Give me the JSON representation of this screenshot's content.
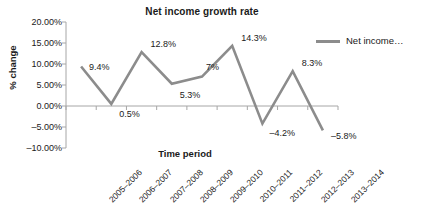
{
  "chart_data": {
    "type": "line",
    "title": "Net income growth rate",
    "xlabel": "Time period",
    "ylabel": "% change",
    "categories": [
      "2005–2006",
      "2006–2007",
      "2007–2008",
      "2008–2009",
      "2009–2010",
      "2010–2011",
      "2011–2012",
      "2012–2013",
      "2013–2014"
    ],
    "values": [
      9.4,
      0.5,
      12.8,
      5.3,
      7,
      14.3,
      -4.2,
      8.3,
      -5.8
    ],
    "point_labels": [
      "9.4%",
      "0.5%",
      "12.8%",
      "5.3%",
      "7%",
      "14.3%",
      "–4.2%",
      "8.3%",
      "–5.8%"
    ],
    "ylim": [
      -10,
      20
    ],
    "ytick_values": [
      20,
      15,
      10,
      5,
      0,
      -5,
      -10
    ],
    "ytick_labels": [
      "20.00%",
      "15.00%",
      "10.00%",
      "5.00%",
      "0.00%",
      "–5.00%",
      "–10.00%"
    ],
    "grid": false,
    "zero_line": true,
    "legend_position": "right",
    "series": [
      {
        "name": "Net income…",
        "color": "#8c8c8c",
        "values": [
          9.4,
          0.5,
          12.8,
          5.3,
          7,
          14.3,
          -4.2,
          8.3,
          -5.8
        ]
      }
    ]
  },
  "legend": {
    "entries": [
      {
        "label": "Net income…"
      }
    ]
  },
  "colors": {
    "series_line": "#8c8c8c",
    "axis": "#a6a6a6",
    "text": "#1a1a1a",
    "background": "#ffffff"
  }
}
